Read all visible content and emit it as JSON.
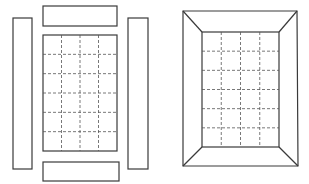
{
  "diagram": {
    "colors": {
      "line": "#3a3a3a",
      "grid": "#555555",
      "background": "#ffffff"
    },
    "figures": [
      {
        "name": "exploded-frame",
        "parts": [
          "top-strip",
          "bottom-strip",
          "left-strip",
          "right-strip",
          "center-panel"
        ],
        "grid": {
          "columns": 4,
          "rows": 6,
          "style": "dashed"
        }
      },
      {
        "name": "assembled-mitered-frame",
        "parts": [
          "outer-frame",
          "inner-panel",
          "miter-lines"
        ],
        "grid": {
          "columns": 4,
          "rows": 6,
          "style": "dashed"
        }
      }
    ]
  }
}
